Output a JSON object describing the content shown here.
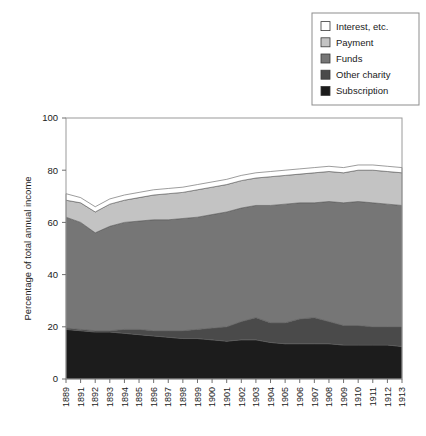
{
  "chart_data": {
    "type": "area",
    "title": "",
    "xlabel": "",
    "ylabel": "Percentage of total annual income",
    "ylim": [
      0,
      100
    ],
    "yticks": [
      0,
      20,
      40,
      60,
      80,
      100
    ],
    "grid": false,
    "stacked": true,
    "legend_position": "top-right",
    "legend_entries": [
      "Interest, etc.",
      "Payment",
      "Funds",
      "Other charity",
      "Subscription"
    ],
    "categories": [
      "1889",
      "1891",
      "1892",
      "1893",
      "1894",
      "1895",
      "1896",
      "1897",
      "1898",
      "1899",
      "1900",
      "1901",
      "1902",
      "1903",
      "1904",
      "1905",
      "1906",
      "1907",
      "1908",
      "1909",
      "1910",
      "1911",
      "1912",
      "1913"
    ],
    "series": [
      {
        "name": "Subscription",
        "color": "#1c1c1c",
        "values": [
          19.0,
          18.5,
          18.0,
          18.0,
          17.5,
          17.0,
          16.5,
          16.0,
          15.5,
          15.5,
          15.0,
          14.5,
          15.0,
          15.0,
          14.0,
          13.5,
          13.5,
          13.5,
          13.5,
          13.0,
          13.0,
          13.0,
          13.0,
          12.5
        ]
      },
      {
        "name": "Other charity",
        "color": "#4a4a4a",
        "values": [
          0.5,
          0.5,
          0.5,
          0.5,
          1.5,
          2.0,
          2.0,
          2.5,
          3.0,
          3.5,
          4.5,
          5.5,
          7.0,
          8.5,
          7.5,
          8.0,
          9.5,
          10.0,
          8.5,
          7.5,
          7.5,
          7.0,
          7.0,
          7.5
        ]
      },
      {
        "name": "Funds",
        "color": "#767676",
        "values": [
          42.5,
          41.0,
          37.5,
          40.0,
          41.0,
          41.5,
          42.5,
          42.5,
          43.0,
          43.0,
          43.5,
          44.0,
          43.5,
          43.0,
          45.0,
          45.5,
          44.5,
          44.0,
          46.0,
          47.0,
          47.5,
          47.5,
          47.0,
          46.5
        ]
      },
      {
        "name": "Payment",
        "color": "#c3c3c3",
        "values": [
          6.5,
          7.5,
          8.0,
          8.5,
          8.5,
          9.0,
          9.5,
          10.0,
          10.0,
          10.5,
          10.5,
          10.5,
          10.5,
          10.5,
          11.0,
          11.0,
          11.0,
          11.5,
          11.5,
          11.5,
          12.0,
          12.5,
          12.5,
          12.5
        ]
      },
      {
        "name": "Interest, etc.",
        "color": "#ffffff",
        "values": [
          2.5,
          2.0,
          2.0,
          2.0,
          2.0,
          2.0,
          2.0,
          2.0,
          2.0,
          2.0,
          2.0,
          2.0,
          2.0,
          2.0,
          2.0,
          2.0,
          2.0,
          2.0,
          2.0,
          2.0,
          2.0,
          2.0,
          2.0,
          2.0
        ]
      }
    ]
  },
  "legend": {
    "items": [
      {
        "label": "Interest, etc.",
        "color": "#ffffff"
      },
      {
        "label": "Payment",
        "color": "#c3c3c3"
      },
      {
        "label": "Funds",
        "color": "#767676"
      },
      {
        "label": "Other charity",
        "color": "#4a4a4a"
      },
      {
        "label": "Subscription",
        "color": "#1c1c1c"
      }
    ]
  },
  "axes": {
    "y_title": "Percentage of total annual income",
    "y_tick_labels": [
      "0",
      "20",
      "40",
      "60",
      "80",
      "100"
    ],
    "x_tick_labels": [
      "1889",
      "1891",
      "1892",
      "1893",
      "1894",
      "1895",
      "1896",
      "1897",
      "1898",
      "1899",
      "1900",
      "1901",
      "1902",
      "1903",
      "1904",
      "1905",
      "1906",
      "1907",
      "1908",
      "1909",
      "1910",
      "1911",
      "1912",
      "1913"
    ]
  }
}
